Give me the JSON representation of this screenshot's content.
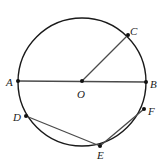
{
  "diagram": {
    "type": "circle-geometry",
    "circle": {
      "center": "O",
      "cx": 82,
      "cy": 82,
      "r": 64
    },
    "points": [
      {
        "name": "A",
        "x": 18,
        "y": 81,
        "label_x": 6,
        "label_y": 86
      },
      {
        "name": "B",
        "x": 146,
        "y": 82,
        "label_x": 150,
        "label_y": 88
      },
      {
        "name": "C",
        "x": 128,
        "y": 35,
        "label_x": 130,
        "label_y": 35
      },
      {
        "name": "O",
        "x": 82,
        "y": 81,
        "label_x": 77,
        "label_y": 98
      },
      {
        "name": "D",
        "x": 26,
        "y": 116,
        "label_x": 13,
        "label_y": 121
      },
      {
        "name": "E",
        "x": 100,
        "y": 146,
        "label_x": 97,
        "label_y": 159
      },
      {
        "name": "F",
        "x": 144,
        "y": 109,
        "label_x": 148,
        "label_y": 115
      }
    ],
    "segments": [
      {
        "from": "A",
        "to": "B"
      },
      {
        "from": "O",
        "to": "C"
      },
      {
        "from": "D",
        "to": "E"
      },
      {
        "from": "E",
        "to": "F"
      }
    ],
    "colors": {
      "circle": "#1a1a1a",
      "segment": "#4a4a4a",
      "point": "#111111",
      "label": "#222222"
    }
  }
}
